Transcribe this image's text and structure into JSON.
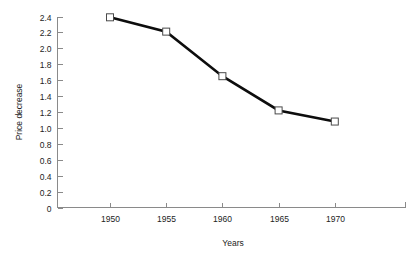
{
  "chart_data": {
    "type": "line",
    "title": "",
    "xlabel": "Years",
    "ylabel": "Price decrease",
    "x": [
      1950,
      1955,
      1960,
      1965,
      1970
    ],
    "categories": [
      "1950",
      "1955",
      "1960",
      "1965",
      "1970"
    ],
    "values": [
      2.39,
      2.21,
      1.65,
      1.22,
      1.08
    ],
    "series": [
      {
        "name": "Price decrease",
        "values": [
          2.39,
          2.21,
          1.65,
          1.22,
          1.08
        ]
      }
    ],
    "ylim": [
      0,
      2.4
    ],
    "xlim": [
      1947.5,
      1973.0
    ],
    "ytick_labels": [
      "0",
      "0.2",
      "0.4",
      "0.6",
      "0.8",
      "1.0",
      "1.2",
      "1.4",
      "1.6",
      "1.8",
      "2.0",
      "2.2",
      "2.4"
    ],
    "ytick_values": [
      0,
      0.2,
      0.4,
      0.6,
      0.8,
      1.0,
      1.2,
      1.4,
      1.6,
      1.8,
      2.0,
      2.2,
      2.4
    ],
    "xtick_labels": [
      "1950",
      "1955",
      "1960",
      "1965",
      "1970"
    ],
    "xtick_values": [
      1950,
      1955,
      1960,
      1965,
      1970
    ],
    "grid": false,
    "legend": false,
    "legend_position": "none",
    "marker": "open-square",
    "line_color": "#0d0d0d",
    "marker_fill": "#ffffff",
    "marker_edge": "#4a4a4a",
    "axis_color": "#8a8a8a",
    "background": "#ffffff"
  }
}
